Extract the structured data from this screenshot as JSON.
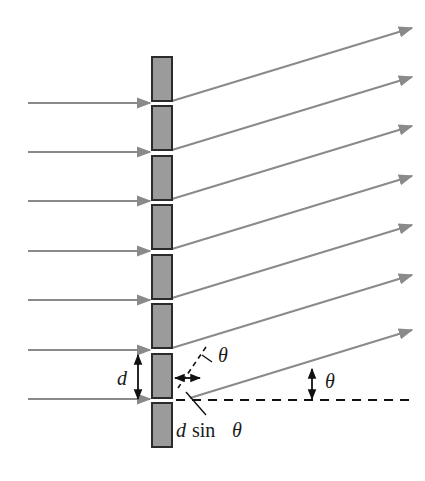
{
  "figure": {
    "background_color": "#ffffff"
  },
  "colors": {
    "barrier_fill": "#9b9b9b",
    "barrier_stroke": "#2b2b2b",
    "ray_color": "#8a8a8a",
    "annotation_color": "#111111",
    "dashed_color": "#111111",
    "text_color": "#1a1a1a"
  },
  "geometry": {
    "grating_x": 152,
    "block_width": 20,
    "block_height": 44,
    "slit_pitch": 49.5,
    "first_block_top": 57,
    "block_count": 8,
    "diffraction_angle_deg": 17,
    "baseline_y": 400,
    "incoming_ray_count": 7,
    "outgoing_ray_count": 7
  },
  "labels": {
    "slit_spacing": "d",
    "angle_at_slit": "θ",
    "angle_at_baseline": "θ",
    "path_difference_d": "d",
    "path_difference_sin": "sin",
    "path_difference_theta": "θ"
  },
  "elements": {
    "barrier_name": "grating-barrier",
    "incoming_name": "incident-ray",
    "outgoing_name": "diffracted-ray",
    "baseline_name": "reference-baseline",
    "normal_name": "wavefront-normal-dashed",
    "d_arrow_name": "slit-spacing-arrow",
    "path_arrow_name": "path-difference-arrow",
    "angle_arrow_name": "angle-measure-arrow",
    "leader_name": "label-leader-line"
  }
}
